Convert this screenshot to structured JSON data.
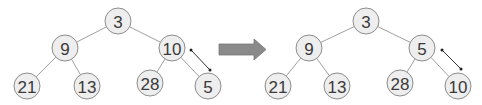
{
  "diagram": {
    "type": "heap-sift-up",
    "before": {
      "nodes": [
        {
          "id": "a",
          "label": "3"
        },
        {
          "id": "b",
          "label": "9"
        },
        {
          "id": "c",
          "label": "10"
        },
        {
          "id": "d",
          "label": "21"
        },
        {
          "id": "e",
          "label": "13"
        },
        {
          "id": "f",
          "label": "28"
        },
        {
          "id": "g",
          "label": "5"
        }
      ],
      "edges": [
        [
          "a",
          "b"
        ],
        [
          "a",
          "c"
        ],
        [
          "b",
          "d"
        ],
        [
          "b",
          "e"
        ],
        [
          "c",
          "f"
        ],
        [
          "c",
          "g"
        ]
      ],
      "swap": [
        "c",
        "g"
      ]
    },
    "transition_arrow": "right-arrow",
    "after": {
      "nodes": [
        {
          "id": "a",
          "label": "3"
        },
        {
          "id": "b",
          "label": "9"
        },
        {
          "id": "c",
          "label": "5"
        },
        {
          "id": "d",
          "label": "21"
        },
        {
          "id": "e",
          "label": "13"
        },
        {
          "id": "f",
          "label": "28"
        },
        {
          "id": "g",
          "label": "10"
        }
      ],
      "edges": [
        [
          "a",
          "b"
        ],
        [
          "a",
          "c"
        ],
        [
          "b",
          "d"
        ],
        [
          "b",
          "e"
        ],
        [
          "c",
          "f"
        ],
        [
          "c",
          "g"
        ]
      ],
      "swap": [
        "c",
        "g"
      ]
    },
    "colors": {
      "node_fill": "#eeeeee",
      "node_stroke": "#8c8c8c",
      "arrow_fill": "#8a8a8a"
    }
  }
}
